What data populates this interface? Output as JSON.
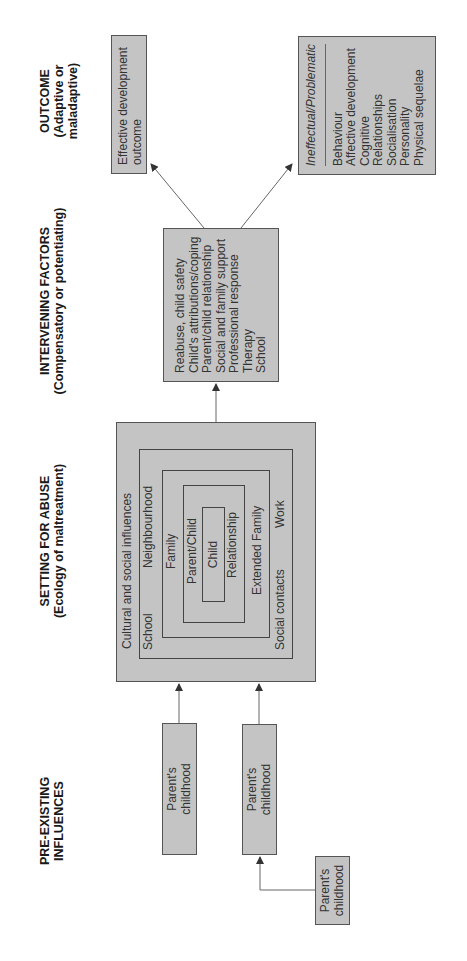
{
  "headers": {
    "pre_existing": "PRE-EXISTING INFLUENCES",
    "setting_title": "SETTING FOR ABUSE",
    "setting_sub": "(Ecology of maltreatment)",
    "intervening_title": "INTERVENING FACTORS",
    "intervening_sub": "(Compensatory or potentiating)",
    "outcome_title": "OUTCOME",
    "outcome_sub": "(Adaptive or maladaptive)"
  },
  "pre_existing": {
    "boxes": [
      {
        "line1": "Parent's",
        "line2": "childhood"
      },
      {
        "line1": "Parent's",
        "line2": "childhood"
      },
      {
        "line1": "Parent's",
        "line2": "childhood"
      }
    ]
  },
  "setting": {
    "outer_label": "Cultural and social influences",
    "ring2_left": "School",
    "ring2_right": "Neighbourhood",
    "ring2_bottom_left": "Social contacts",
    "ring2_bottom_right": "Work",
    "ring3_label": "Family",
    "ring3_bottom": "Extended Family",
    "ring4_label": "Parent/Child",
    "ring4_bottom": "Relationship",
    "core_label": "Child"
  },
  "intervening": {
    "items": [
      "Reabuse, child safety",
      "Child's attributions/coping",
      "Parent/child relationship",
      "Social and family support",
      "Professional response",
      "Therapy",
      "School"
    ]
  },
  "outcome": {
    "effective_line1": "Effective development",
    "effective_line2": "outcome",
    "ineffectual_title": "Ineffectual/Problematic",
    "ineffectual_items": [
      "Behaviour",
      "Affective development",
      "Cognitive",
      "Relationships",
      "Socialisation",
      "Personality",
      "Physical sequelae"
    ]
  },
  "colors": {
    "box_fill": "#c4c4c4",
    "border": "#555555",
    "line": "#555555"
  }
}
